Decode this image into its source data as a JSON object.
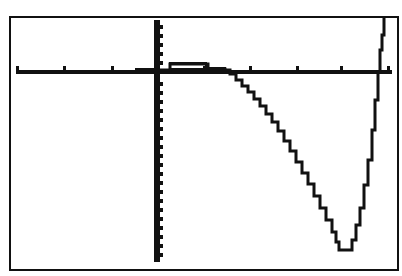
{
  "device": "graphing calculator screen",
  "window": {
    "frame": {
      "left": 10,
      "top": 17,
      "right": 398,
      "bottom": 270
    },
    "colors": {
      "background": "#ffffff",
      "ink": "#111111"
    }
  },
  "axes": {
    "x_axis_pixel_y": 72,
    "y_axis_pixel_x": 157,
    "x_ticks_px": [
      17,
      64,
      112,
      204,
      250,
      297,
      341,
      388
    ],
    "y_ticks_px": [
      25,
      34,
      43,
      52,
      61,
      82,
      91,
      100,
      109,
      118,
      127,
      136,
      145,
      154,
      163,
      172,
      181,
      190,
      199,
      208,
      217,
      226,
      235,
      244,
      253
    ]
  },
  "curve": {
    "description": "polynomial-like curve: nearly flat near zero, slight bump above axis, then dips to a deep minimum and rises steeply",
    "points_px": [
      [
        135,
        71
      ],
      [
        150,
        71
      ],
      [
        157,
        70
      ],
      [
        170,
        64
      ],
      [
        205,
        64
      ],
      [
        208,
        69
      ],
      [
        225,
        70
      ],
      [
        230,
        74
      ],
      [
        236,
        80
      ],
      [
        242,
        86
      ],
      [
        248,
        92
      ],
      [
        254,
        99
      ],
      [
        260,
        106
      ],
      [
        266,
        114
      ],
      [
        272,
        122
      ],
      [
        278,
        131
      ],
      [
        284,
        141
      ],
      [
        290,
        151
      ],
      [
        296,
        162
      ],
      [
        302,
        173
      ],
      [
        308,
        184
      ],
      [
        314,
        196
      ],
      [
        320,
        208
      ],
      [
        326,
        220
      ],
      [
        332,
        232
      ],
      [
        336,
        242
      ],
      [
        339,
        250
      ],
      [
        348,
        250
      ],
      [
        352,
        240
      ],
      [
        356,
        225
      ],
      [
        360,
        208
      ],
      [
        364,
        185
      ],
      [
        368,
        160
      ],
      [
        372,
        130
      ],
      [
        375,
        100
      ],
      [
        378,
        72
      ],
      [
        380,
        50
      ],
      [
        382,
        35
      ],
      [
        384,
        18
      ]
    ]
  }
}
